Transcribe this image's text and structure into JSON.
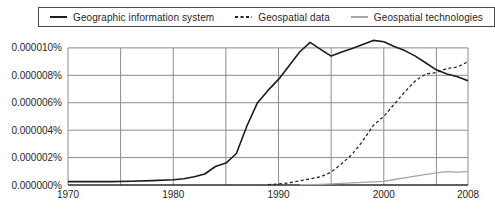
{
  "chart_data": {
    "type": "line",
    "title": "",
    "xlabel": "",
    "ylabel": "",
    "xlim": [
      1970,
      2008
    ],
    "ylim": [
      0,
      10.7
    ],
    "y_unit": "percent, values expressed in millionths (1 = 0.000001%)",
    "grid": true,
    "grid_color": "#8c8c8c",
    "axis_color": "#2b2b2b",
    "label_color": "#1f1f1f",
    "background_color": "#ffffff",
    "legend_position": "top-center",
    "legend_border_color": "#4a4a4a",
    "xticks": [
      {
        "value": 1970,
        "label": "1970"
      },
      {
        "value": 1980,
        "label": "1980"
      },
      {
        "value": 1990,
        "label": "1990"
      },
      {
        "value": 2000,
        "label": "2000"
      },
      {
        "value": 2008,
        "label": "2008"
      }
    ],
    "yticks": [
      {
        "value": 0,
        "label": "0.000000%"
      },
      {
        "value": 2,
        "label": "0.000002%"
      },
      {
        "value": 4,
        "label": "0.000004%"
      },
      {
        "value": 6,
        "label": "0.000006%"
      },
      {
        "value": 8,
        "label": "0.000008%"
      },
      {
        "value": 10,
        "label": "0.000010%"
      }
    ],
    "grid_years": [
      1975,
      1980,
      1985,
      1990,
      1995,
      2000,
      2005
    ],
    "series": [
      {
        "name": "Geographic information system",
        "color": "#1c1c1c",
        "dash": "",
        "width": 1.6,
        "points": [
          [
            1970,
            0.25
          ],
          [
            1972,
            0.25
          ],
          [
            1974,
            0.25
          ],
          [
            1976,
            0.28
          ],
          [
            1978,
            0.32
          ],
          [
            1980,
            0.38
          ],
          [
            1981,
            0.45
          ],
          [
            1982,
            0.6
          ],
          [
            1983,
            0.8
          ],
          [
            1984,
            1.35
          ],
          [
            1985,
            1.6
          ],
          [
            1986,
            2.3
          ],
          [
            1987,
            4.3
          ],
          [
            1988,
            6.0
          ],
          [
            1989,
            6.9
          ],
          [
            1990,
            7.7
          ],
          [
            1991,
            8.7
          ],
          [
            1992,
            9.7
          ],
          [
            1993,
            10.4
          ],
          [
            1994,
            9.9
          ],
          [
            1995,
            9.4
          ],
          [
            1996,
            9.7
          ],
          [
            1997,
            9.95
          ],
          [
            1998,
            10.25
          ],
          [
            1999,
            10.55
          ],
          [
            2000,
            10.45
          ],
          [
            2001,
            10.1
          ],
          [
            2002,
            9.8
          ],
          [
            2003,
            9.4
          ],
          [
            2004,
            8.9
          ],
          [
            2005,
            8.4
          ],
          [
            2006,
            8.1
          ],
          [
            2007,
            7.9
          ],
          [
            2008,
            7.6
          ]
        ]
      },
      {
        "name": "Geospatial data",
        "color": "#262626",
        "dash": "3,2.5",
        "width": 1.3,
        "points": [
          [
            1989,
            0.02
          ],
          [
            1990,
            0.08
          ],
          [
            1991,
            0.15
          ],
          [
            1992,
            0.3
          ],
          [
            1993,
            0.45
          ],
          [
            1994,
            0.6
          ],
          [
            1995,
            0.95
          ],
          [
            1996,
            1.55
          ],
          [
            1997,
            2.25
          ],
          [
            1998,
            3.2
          ],
          [
            1999,
            4.35
          ],
          [
            2000,
            5.0
          ],
          [
            2001,
            5.9
          ],
          [
            2002,
            6.8
          ],
          [
            2003,
            7.6
          ],
          [
            2004,
            8.1
          ],
          [
            2005,
            8.2
          ],
          [
            2006,
            8.5
          ],
          [
            2007,
            8.6
          ],
          [
            2008,
            9.0
          ]
        ]
      },
      {
        "name": "Geospatial technologies",
        "color": "#a6a6a6",
        "dash": "",
        "width": 1.3,
        "points": [
          [
            1992,
            0.02
          ],
          [
            1993,
            0.03
          ],
          [
            1994,
            0.05
          ],
          [
            1995,
            0.08
          ],
          [
            1996,
            0.12
          ],
          [
            1997,
            0.16
          ],
          [
            1998,
            0.2
          ],
          [
            1999,
            0.23
          ],
          [
            2000,
            0.27
          ],
          [
            2001,
            0.4
          ],
          [
            2002,
            0.52
          ],
          [
            2003,
            0.65
          ],
          [
            2004,
            0.78
          ],
          [
            2005,
            0.88
          ],
          [
            2006,
            0.97
          ],
          [
            2007,
            0.93
          ],
          [
            2008,
            0.97
          ]
        ]
      }
    ]
  }
}
